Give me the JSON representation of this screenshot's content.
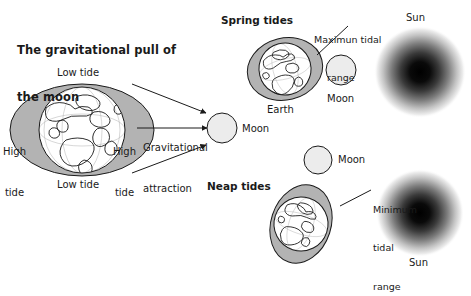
{
  "figure": {
    "title_line1": "The gravitational pull of",
    "title_line2": "the moon",
    "background_color": "#ffffff",
    "ink_color": "#1a1a1a",
    "ocean_bulge_color": "#b3b3b3",
    "globe_color": "#ffffff",
    "moon_color": "#ececec",
    "sun_color": "#000000"
  },
  "main_panel": {
    "low_tide_top": "Low tide",
    "low_tide_bottom": "Low tide",
    "high_tide_left_line1": "High",
    "high_tide_left_line2": "tide",
    "high_tide_right_line1": "High",
    "high_tide_right_line2": "tide",
    "attraction_line1": "Gravitational",
    "attraction_line2": "attraction",
    "moon_label": "Moon"
  },
  "spring_panel": {
    "heading": "Spring tides",
    "range_line1": "Maximun tidal",
    "range_line2": "range",
    "earth_label": "Earth",
    "moon_label": "Moon",
    "sun_label": "Sun"
  },
  "neap_panel": {
    "heading": "Neap tides",
    "moon_label": "Moon",
    "range_line1": "Minimum",
    "range_line2": "tidal",
    "range_line3": "range",
    "sun_label": "Sun"
  }
}
